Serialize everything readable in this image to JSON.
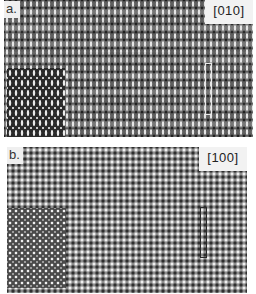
{
  "figure": {
    "panels": [
      {
        "id": "a",
        "label": "a.",
        "zone_axis": "[010]",
        "description": "High-resolution lattice image with darker inset simulation at lower-left and outlined unit cell at right",
        "inset": "darker simulated image region, lower-left",
        "unit_cell_outline_color": "#e8e8e8"
      },
      {
        "id": "b",
        "label": "b.",
        "zone_axis": "[100]",
        "description": "High-resolution lattice image with darker inset simulation at lower-left and outlined unit cell at right",
        "inset": "darker simulated image region, lower-left",
        "unit_cell_outline_color": "#2a2a2a"
      }
    ]
  }
}
